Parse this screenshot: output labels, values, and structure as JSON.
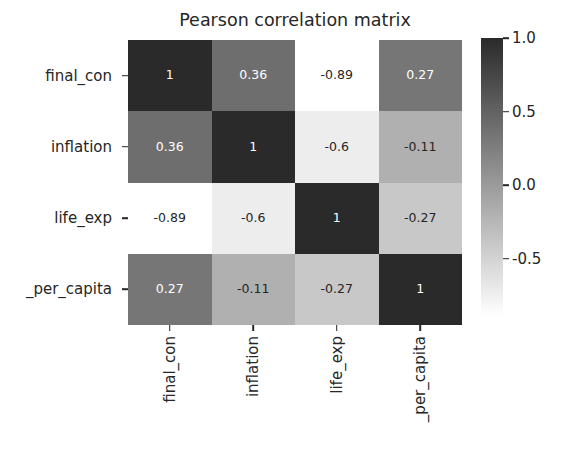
{
  "chart_data": {
    "type": "heatmap",
    "title": "Pearson correlation matrix",
    "xlabel": "",
    "ylabel": "",
    "colormap": "gray_r",
    "grid": false,
    "legend_position": "right-colorbar",
    "categories_x": [
      "final_con",
      "inflation",
      "life_exp",
      "_per_capita"
    ],
    "categories_y": [
      "final_con",
      "inflation",
      "life_exp",
      "_per_capita"
    ],
    "matrix": [
      [
        1,
        0.36,
        -0.89,
        0.27
      ],
      [
        0.36,
        1,
        -0.6,
        -0.11
      ],
      [
        -0.89,
        -0.6,
        1,
        -0.27
      ],
      [
        0.27,
        -0.11,
        -0.27,
        1
      ]
    ],
    "cell_labels": [
      [
        "1",
        "0.36",
        "-0.89",
        "0.27"
      ],
      [
        "0.36",
        "1",
        "-0.6",
        "-0.11"
      ],
      [
        "-0.89",
        "-0.6",
        "1",
        "-0.27"
      ],
      [
        "0.27",
        "-0.11",
        "-0.27",
        "1"
      ]
    ],
    "cell_fill_colors": [
      [
        "#2a2a2a",
        "#6e6e6e",
        "#ffffff",
        "#767676"
      ],
      [
        "#6e6e6e",
        "#2a2a2a",
        "#ededed",
        "#b0b0b0"
      ],
      [
        "#ffffff",
        "#ededed",
        "#2a2a2a",
        "#c8c8c8"
      ],
      [
        "#767676",
        "#b0b0b0",
        "#c8c8c8",
        "#2a2a2a"
      ]
    ],
    "cell_text_colors": [
      [
        "#ffffff",
        "#ffffff",
        "#262626",
        "#ffffff"
      ],
      [
        "#ffffff",
        "#ffffff",
        "#262626",
        "#262626"
      ],
      [
        "#262626",
        "#262626",
        "#ffffff",
        "#262626"
      ],
      [
        "#ffffff",
        "#262626",
        "#262626",
        "#ffffff"
      ]
    ],
    "colorbar": {
      "vmin": -0.89,
      "vmax": 1.0,
      "top_color": "#2a2a2a",
      "bottom_color": "#ffffff",
      "ticks": [
        "1.0",
        "0.5",
        "0.0",
        "-0.5"
      ],
      "tick_values": [
        1.0,
        0.5,
        0.0,
        -0.5
      ]
    }
  }
}
